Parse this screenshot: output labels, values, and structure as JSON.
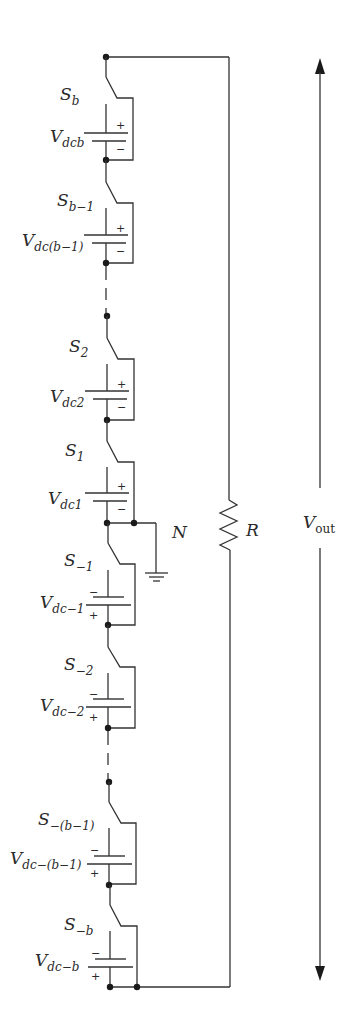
{
  "diagram": {
    "type": "cascaded-dc-source circuit schematic",
    "colors": {
      "line": "#333333",
      "text": "#2a2a2a",
      "background": "#ffffff"
    },
    "cells": [
      {
        "id": "b",
        "switch": {
          "base": "S",
          "sub": "b"
        },
        "source": {
          "base": "V",
          "sub": "dcb"
        },
        "polarity_top": "+",
        "polarity_bottom": "−"
      },
      {
        "id": "b-1",
        "switch": {
          "base": "S",
          "sub": "b−1"
        },
        "source": {
          "base": "V",
          "sub": "dc(b−1)"
        },
        "polarity_top": "+",
        "polarity_bottom": "−"
      },
      {
        "id": "2",
        "switch": {
          "base": "S",
          "sub": "2"
        },
        "source": {
          "base": "V",
          "sub": "dc2"
        },
        "polarity_top": "+",
        "polarity_bottom": "−"
      },
      {
        "id": "1",
        "switch": {
          "base": "S",
          "sub": "1"
        },
        "source": {
          "base": "V",
          "sub": "dc1"
        },
        "polarity_top": "+",
        "polarity_bottom": "−"
      },
      {
        "id": "-1",
        "switch": {
          "base": "S",
          "sub": "−1"
        },
        "source": {
          "base": "V",
          "sub": "dc−1"
        },
        "polarity_top": "−",
        "polarity_bottom": "+"
      },
      {
        "id": "-2",
        "switch": {
          "base": "S",
          "sub": "−2"
        },
        "source": {
          "base": "V",
          "sub": "dc−2"
        },
        "polarity_top": "−",
        "polarity_bottom": "+"
      },
      {
        "id": "-(b-1)",
        "switch": {
          "base": "S",
          "sub": "−(b−1)"
        },
        "source": {
          "base": "V",
          "sub": "dc−(b−1)"
        },
        "polarity_top": "−",
        "polarity_bottom": "+"
      },
      {
        "id": "-b",
        "switch": {
          "base": "S",
          "sub": "−b"
        },
        "source": {
          "base": "V",
          "sub": "dc−b"
        },
        "polarity_top": "−",
        "polarity_bottom": "+"
      }
    ],
    "neutral": {
      "label": "N"
    },
    "load": {
      "label": "R"
    },
    "output": {
      "base": "V",
      "sub": "out"
    }
  }
}
